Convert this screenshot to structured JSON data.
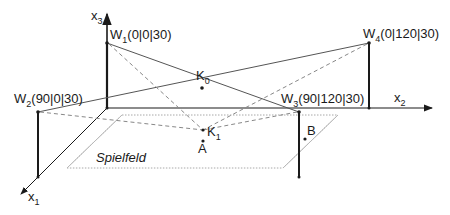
{
  "diagram": {
    "axes": {
      "x1": {
        "label": "x",
        "sub": "1"
      },
      "x2": {
        "label": "x",
        "sub": "2"
      },
      "x3": {
        "label": "x",
        "sub": "3"
      }
    },
    "points": {
      "W1": {
        "name": "W",
        "sub": "1",
        "coords": "(0|0|30)"
      },
      "W2": {
        "name": "W",
        "sub": "2",
        "coords": "(90|0|30)"
      },
      "W3": {
        "name": "W",
        "sub": "3",
        "coords": "(90|120|30)"
      },
      "W4": {
        "name": "W",
        "sub": "4",
        "coords": "(0|120|30)"
      },
      "K0": {
        "name": "K",
        "sub": "0"
      },
      "K1": {
        "name": "K",
        "sub": "1"
      },
      "A": {
        "name": "A"
      },
      "B": {
        "name": "B"
      }
    },
    "field_label": "Spielfeld",
    "colors": {
      "line": "#1a1a1a",
      "thin": "#555555",
      "dashed": "#888888",
      "field": "#b0b0b0"
    }
  }
}
